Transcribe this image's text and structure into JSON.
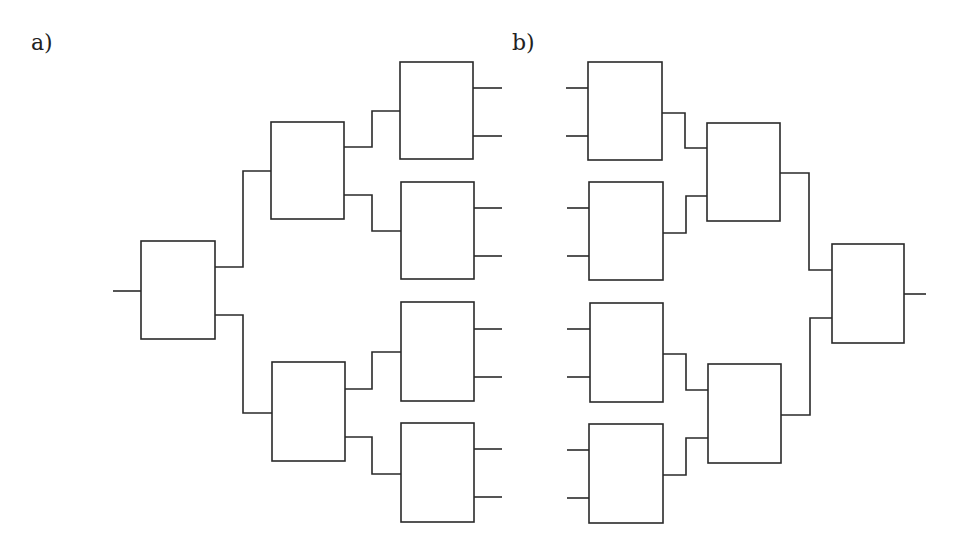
{
  "panels": [
    {
      "id": "a",
      "label": "a)",
      "description": "Binary fan-out tree: 1 input -> 8 outputs",
      "boxes": [
        {
          "id": "root",
          "x": 141,
          "y": 241,
          "w": 74,
          "h": 98
        },
        {
          "id": "l1-top",
          "x": 271,
          "y": 122,
          "w": 73,
          "h": 97
        },
        {
          "id": "l1-bottom",
          "x": 272,
          "y": 362,
          "w": 73,
          "h": 99
        },
        {
          "id": "leaf-1",
          "x": 400,
          "y": 62,
          "w": 73,
          "h": 97
        },
        {
          "id": "leaf-2",
          "x": 401,
          "y": 182,
          "w": 73,
          "h": 97
        },
        {
          "id": "leaf-3",
          "x": 401,
          "y": 302,
          "w": 73,
          "h": 99
        },
        {
          "id": "leaf-4",
          "x": 401,
          "y": 423,
          "w": 73,
          "h": 99
        }
      ],
      "wires": [
        "M113 291 H141",
        "M215 267 H243 V171 H271",
        "M215 315 H243 V413 H272",
        "M344 147 H372 V111 H400",
        "M344 195 H372 V231 H401",
        "M345 389 H372 V352 H401",
        "M345 437 H372 V474 H401",
        "M473 88 H502",
        "M473 136 H502",
        "M474 208 H502",
        "M474 256 H502",
        "M474 329 H502",
        "M474 377 H502",
        "M474 449 H502",
        "M474 497 H502"
      ]
    },
    {
      "id": "b",
      "label": "b)",
      "description": "Binary fan-in tree: 8 inputs -> 1 output",
      "boxes": [
        {
          "id": "leaf-1",
          "x": 588,
          "y": 62,
          "w": 74,
          "h": 98
        },
        {
          "id": "leaf-2",
          "x": 589,
          "y": 182,
          "w": 74,
          "h": 98
        },
        {
          "id": "leaf-3",
          "x": 590,
          "y": 303,
          "w": 73,
          "h": 99
        },
        {
          "id": "leaf-4",
          "x": 589,
          "y": 424,
          "w": 74,
          "h": 99
        },
        {
          "id": "l1-top",
          "x": 707,
          "y": 123,
          "w": 73,
          "h": 98
        },
        {
          "id": "l1-bottom",
          "x": 708,
          "y": 364,
          "w": 73,
          "h": 99
        },
        {
          "id": "root",
          "x": 832,
          "y": 244,
          "w": 72,
          "h": 99
        }
      ],
      "wires": [
        "M566 88 H588",
        "M566 136 H588",
        "M567 208 H589",
        "M567 256 H589",
        "M567 329 H590",
        "M567 377 H590",
        "M567 450 H589",
        "M567 498 H589",
        "M662 113 H685 V148 H707",
        "M663 233 H686 V196 H707",
        "M663 354 H686 V390 H708",
        "M663 475 H686 V438 H708",
        "M780 173 H809 V270 H832",
        "M781 415 H810 V318 H832",
        "M904 294 H926"
      ]
    }
  ],
  "style": {
    "stroke_color": "#2a2a2a",
    "background": "#ffffff"
  }
}
